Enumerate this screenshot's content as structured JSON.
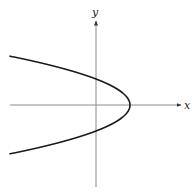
{
  "diagram": {
    "type": "sideways-parabola",
    "axes": {
      "x_label": "x",
      "y_label": "y",
      "axis_color": "#8a8a8a",
      "origin_px": [
        96,
        105
      ]
    },
    "curve": {
      "description": "Parabola opening to the left, vertex on positive x-axis, crossing the y-axis above and below the origin",
      "color": "#1a1a1a",
      "vertex_px": [
        130,
        105
      ],
      "y_intercepts_px": [
        79,
        131
      ]
    }
  }
}
